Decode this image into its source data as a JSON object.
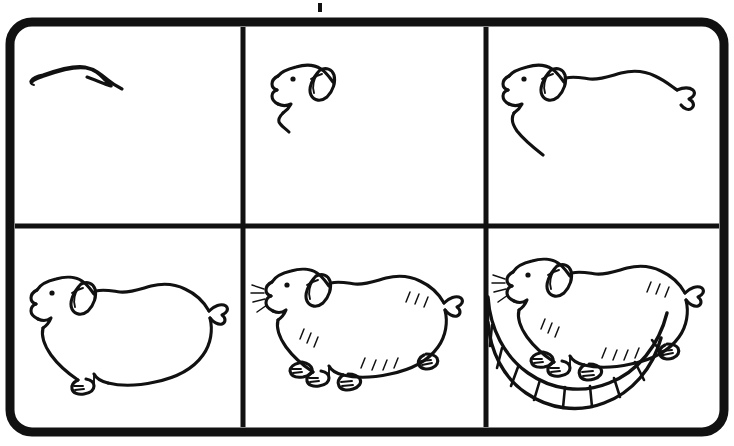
{
  "page": {
    "style": "black line art on white",
    "background_color": "#ffffff",
    "ink_color": "#111111",
    "width": 734,
    "height": 446
  },
  "frame": {
    "name": "rounded-rectangle-border",
    "corner_radius": 22,
    "stroke_width": 9,
    "color": "#111111",
    "x": 10,
    "y": 22,
    "width": 714,
    "height": 410
  },
  "grid": {
    "columns": 3,
    "rows": 2,
    "vertical_dividers_x": [
      243,
      486
    ],
    "horizontal_dividers_y": [
      226
    ],
    "divider_stroke_width": 5,
    "divider_color": "#111111"
  },
  "panels": [
    {
      "index": 1,
      "step_number": "1",
      "row": 1,
      "column": 1,
      "label": "Step 1 - top curve of head",
      "description": "A single shallow arc forming the top of the guinea pig's head and brow.",
      "elements": [
        "head-top-arc"
      ]
    },
    {
      "index": 2,
      "step_number": "2",
      "row": 1,
      "column": 2,
      "label": "Step 2 - head with eye, ear and muzzle",
      "description": "The head outline is closed with a blunt nose, an open mouth notch, an angular chin line, a dot eye and a rounded ear with an inner fold.",
      "elements": [
        "head-outline",
        "eye-dot",
        "ear",
        "ear-inner-fold",
        "chin-line"
      ]
    },
    {
      "index": 3,
      "step_number": "3",
      "row": 1,
      "column": 3,
      "label": "Step 3 - back line and tail stub",
      "description": "A long wavy spine line runs from the back of the head to a small pointed tail stub, and the chest line drops down from the chin.",
      "elements": [
        "head-outline",
        "eye-dot",
        "ear",
        "back-line",
        "tail-stub",
        "chest-line"
      ]
    },
    {
      "index": 4,
      "step_number": "4",
      "row": 2,
      "column": 1,
      "label": "Step 4 - closed body outline with one paw",
      "description": "The rounded belly and rump close the body silhouette; one front paw with three toes rests on the ground line.",
      "elements": [
        "head-outline",
        "eye-dot",
        "ear",
        "body-outline",
        "tail-stub",
        "front-paw",
        "belly-line"
      ]
    },
    {
      "index": 5,
      "step_number": "5",
      "row": 2,
      "column": 2,
      "label": "Step 5 - four feet, whiskers and fur marks",
      "description": "All four feet with toes are drawn, whiskers radiate from the snout, and short fur tick marks are added on the shoulder, rump and belly.",
      "elements": [
        "body-outline",
        "eye-dot",
        "ear",
        "whiskers",
        "four-feet",
        "fur-marks",
        "tail-stub"
      ]
    },
    {
      "index": 6,
      "step_number": "6",
      "row": 2,
      "column": 3,
      "label": "Step 6 - guinea pig on an exercise wheel",
      "description": "The finished guinea pig stands on a curved exercise wheel drawn as two concentric arcs crossed by ladder-like rungs.",
      "elements": [
        "body-outline",
        "eye-dot",
        "ear",
        "whiskers",
        "four-feet",
        "fur-marks",
        "exercise-wheel"
      ],
      "wheel": {
        "name": "exercise-wheel",
        "rung_count": 10,
        "rail_count": 2
      }
    }
  ],
  "artifacts": [
    {
      "name": "scan-speck",
      "x": 318,
      "y": 3,
      "width": 4,
      "height": 9
    }
  ]
}
